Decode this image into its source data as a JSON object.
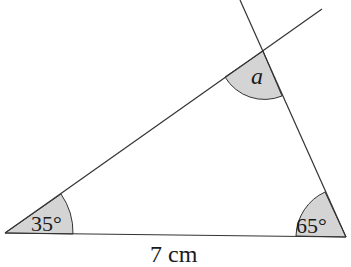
{
  "diagram": {
    "type": "triangle",
    "vertices": {
      "left": [
        5,
        233
      ],
      "right": [
        346,
        237
      ],
      "top": [
        263,
        51
      ]
    },
    "extensions": {
      "left_side_to": [
        322,
        9
      ],
      "right_side_to": [
        240,
        0
      ]
    },
    "angles": [
      {
        "vertex": "left",
        "label": "35°"
      },
      {
        "vertex": "right",
        "label": "65°"
      },
      {
        "vertex": "top",
        "label": "a"
      }
    ],
    "side_label": "7 cm",
    "shade_color": "#d4d4d4",
    "line_color": "#333333"
  }
}
